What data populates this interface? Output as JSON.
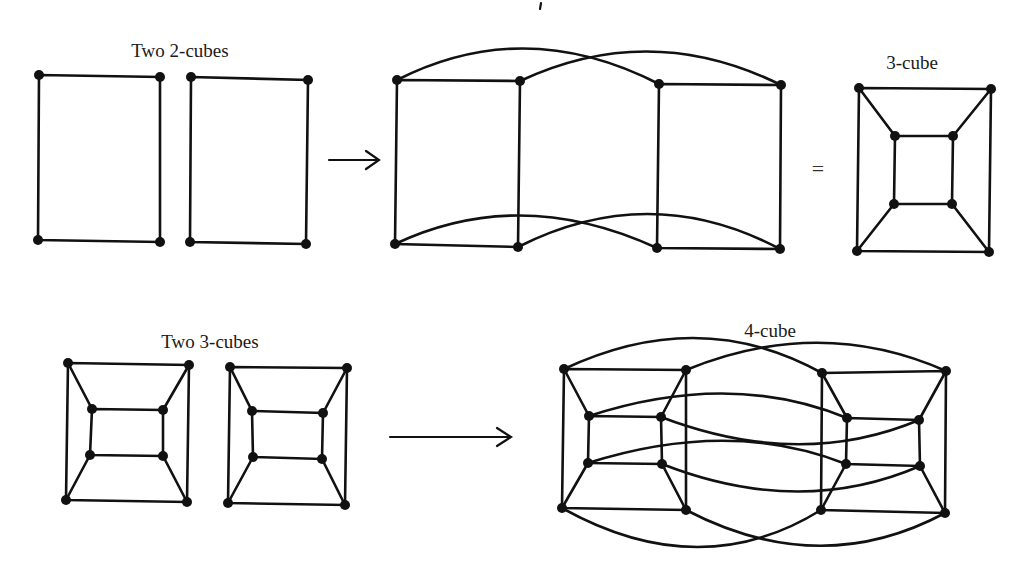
{
  "labels": {
    "two_2cubes": "Two 2-cubes",
    "three_cube": "3-cube",
    "two_3cubes": "Two 3-cubes",
    "four_cube": "4-cube",
    "equals": "="
  },
  "colors": {
    "ink": "#111111",
    "background": "#ffffff"
  },
  "diagram": {
    "rows": [
      {
        "input": "Two 2-cubes",
        "operation": "arrow",
        "output": "3-cube (drawn two ways)"
      },
      {
        "input": "Two 3-cubes",
        "operation": "arrow",
        "output": "4-cube"
      }
    ]
  }
}
